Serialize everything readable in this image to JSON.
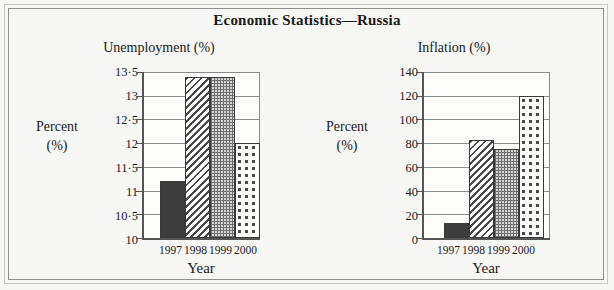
{
  "figure": {
    "title": "Economic Statistics—Russia",
    "frame_color": "#8f8f8f",
    "background": "#f7f7f5"
  },
  "panels": [
    {
      "subtitle": "Unemployment (%)",
      "y_axis_label_line1": "Percent",
      "y_axis_label_line2": "(%)",
      "x_axis_title": "Year",
      "y_ticks": [
        "13·5",
        "13",
        "12·5",
        "12",
        "11·5",
        "11",
        "10·5",
        "10"
      ],
      "x_ticks": [
        "1997",
        "1998",
        "1999",
        "2000"
      ]
    },
    {
      "subtitle": "Inflation (%)",
      "y_axis_label_line1": "Percent",
      "y_axis_label_line2": "(%)",
      "x_axis_title": "Year",
      "y_ticks": [
        "140",
        "120",
        "100",
        "80",
        "60",
        "40",
        "20",
        "0"
      ],
      "x_ticks": [
        "1997",
        "1998",
        "1999",
        "2000"
      ]
    }
  ],
  "chart_data": [
    {
      "type": "bar",
      "title": "Unemployment (%)",
      "xlabel": "Year",
      "ylabel": "Percent (%)",
      "categories": [
        "1997",
        "1998",
        "1999",
        "2000"
      ],
      "values": [
        11.2,
        13.4,
        13.4,
        12.0
      ],
      "ylim": [
        10,
        13.5
      ],
      "ytick_values": [
        10,
        10.5,
        11,
        11.5,
        12,
        12.5,
        13,
        13.5
      ],
      "ytick_labels": [
        "10",
        "10·5",
        "11",
        "11·5",
        "12",
        "12·5",
        "13",
        "13·5"
      ],
      "grid": true,
      "legend": "none",
      "bar_patterns": [
        "solid-dark",
        "diagonal-hatch",
        "dense-checker",
        "sparse-dots"
      ]
    },
    {
      "type": "bar",
      "title": "Inflation (%)",
      "xlabel": "Year",
      "ylabel": "Percent (%)",
      "categories": [
        "1997",
        "1998",
        "1999",
        "2000"
      ],
      "values": [
        13,
        83,
        75,
        120
      ],
      "ylim": [
        0,
        140
      ],
      "ytick_values": [
        0,
        20,
        40,
        60,
        80,
        100,
        120,
        140
      ],
      "ytick_labels": [
        "0",
        "20",
        "40",
        "60",
        "80",
        "100",
        "120",
        "140"
      ],
      "grid": true,
      "legend": "none",
      "bar_patterns": [
        "solid-dark",
        "diagonal-hatch",
        "dense-checker",
        "sparse-dots"
      ]
    }
  ]
}
